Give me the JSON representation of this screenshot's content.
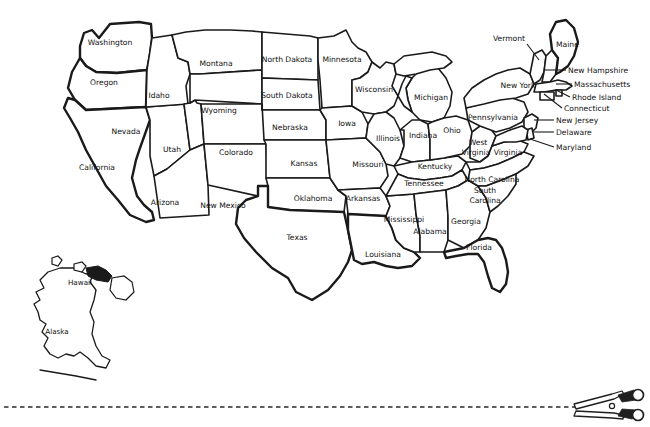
{
  "document": {
    "title": "United States Outline Map",
    "style": "black-and-white printable outline map"
  },
  "map": {
    "name": "United States of America",
    "stroke_color": "#1a1a1a",
    "fill_color": "#ffffff",
    "background_color": "#ffffff",
    "states": [
      {
        "id": "washington",
        "label": "Washington",
        "x": 110,
        "y": 45,
        "anchor": "middle",
        "lines": 1
      },
      {
        "id": "oregon",
        "label": "Oregon",
        "x": 104,
        "y": 85,
        "anchor": "middle",
        "lines": 1
      },
      {
        "id": "california",
        "label": "California",
        "x": 97,
        "y": 170,
        "anchor": "middle",
        "lines": 1
      },
      {
        "id": "idaho",
        "label": "Idaho",
        "x": 159,
        "y": 98,
        "anchor": "middle",
        "lines": 1
      },
      {
        "id": "nevada",
        "label": "Nevada",
        "x": 126,
        "y": 134,
        "anchor": "middle",
        "lines": 1
      },
      {
        "id": "utah",
        "label": "Utah",
        "x": 172,
        "y": 152,
        "anchor": "middle",
        "lines": 1
      },
      {
        "id": "arizona",
        "label": "Arizona",
        "x": 165,
        "y": 205,
        "anchor": "middle",
        "lines": 1
      },
      {
        "id": "montana",
        "label": "Montana",
        "x": 216,
        "y": 66,
        "anchor": "middle",
        "lines": 1
      },
      {
        "id": "wyoming",
        "label": "Wyoming",
        "x": 219,
        "y": 113,
        "anchor": "middle",
        "lines": 1
      },
      {
        "id": "colorado",
        "label": "Colorado",
        "x": 236,
        "y": 155,
        "anchor": "middle",
        "lines": 1
      },
      {
        "id": "new-mexico",
        "label": "New Mexico",
        "x": 223,
        "y": 208,
        "anchor": "middle",
        "lines": 1
      },
      {
        "id": "north-dakota",
        "label": "North  Dakota",
        "x": 287,
        "y": 62,
        "anchor": "middle",
        "lines": 1
      },
      {
        "id": "south-dakota",
        "label": "South  Dakota",
        "x": 287,
        "y": 98,
        "anchor": "middle",
        "lines": 1
      },
      {
        "id": "nebraska",
        "label": "Nebraska",
        "x": 290,
        "y": 130,
        "anchor": "middle",
        "lines": 1
      },
      {
        "id": "kansas",
        "label": "Kansas",
        "x": 304,
        "y": 166,
        "anchor": "middle",
        "lines": 1
      },
      {
        "id": "oklahoma",
        "label": "Oklahoma",
        "x": 313,
        "y": 201,
        "anchor": "middle",
        "lines": 1
      },
      {
        "id": "texas",
        "label": "Texas",
        "x": 297,
        "y": 240,
        "anchor": "middle",
        "lines": 1
      },
      {
        "id": "minnesota",
        "label": "Minnesota",
        "x": 342,
        "y": 62,
        "anchor": "middle",
        "lines": 1
      },
      {
        "id": "iowa",
        "label": "Iowa",
        "x": 347,
        "y": 126,
        "anchor": "middle",
        "lines": 1
      },
      {
        "id": "missouri",
        "label": "Missouri",
        "x": 368,
        "y": 167,
        "anchor": "middle",
        "lines": 1
      },
      {
        "id": "arkansas",
        "label": "Arkansas",
        "x": 363,
        "y": 201,
        "anchor": "middle",
        "lines": 1
      },
      {
        "id": "louisiana",
        "label": "Louisiana",
        "x": 383,
        "y": 257,
        "anchor": "middle",
        "lines": 1
      },
      {
        "id": "wisconsin",
        "label": "Wisconsin",
        "x": 374,
        "y": 92,
        "anchor": "middle",
        "lines": 1
      },
      {
        "id": "illinois",
        "label": "Illinois",
        "x": 388,
        "y": 141,
        "anchor": "middle",
        "lines": 1
      },
      {
        "id": "mississippi",
        "label": "Mississippi",
        "x": 404,
        "y": 222,
        "anchor": "middle",
        "lines": 1
      },
      {
        "id": "michigan",
        "label": "Michigan",
        "x": 431,
        "y": 100,
        "anchor": "middle",
        "lines": 1
      },
      {
        "id": "indiana",
        "label": "Indiana",
        "x": 423,
        "y": 138,
        "anchor": "middle",
        "lines": 1
      },
      {
        "id": "kentucky",
        "label": "Kentucky",
        "x": 435,
        "y": 169,
        "anchor": "middle",
        "lines": 1
      },
      {
        "id": "tennessee",
        "label": "Tennessee",
        "x": 424,
        "y": 186,
        "anchor": "middle",
        "lines": 1
      },
      {
        "id": "alabama",
        "label": "Alabama",
        "x": 430,
        "y": 234,
        "anchor": "middle",
        "lines": 1
      },
      {
        "id": "ohio",
        "label": "Ohio",
        "x": 452,
        "y": 133,
        "anchor": "middle",
        "lines": 1
      },
      {
        "id": "georgia",
        "label": "Georgia",
        "x": 466,
        "y": 224,
        "anchor": "middle",
        "lines": 1
      },
      {
        "id": "florida",
        "label": "Florida",
        "x": 479,
        "y": 250,
        "anchor": "middle",
        "lines": 1
      },
      {
        "id": "west-virginia",
        "label": "West",
        "x": 478,
        "y": 145,
        "anchor": "middle",
        "lines": 2,
        "label_line2": "Virginia",
        "x2": 476,
        "y2": 155
      },
      {
        "id": "virginia",
        "label": "Virginia",
        "x": 508,
        "y": 155,
        "anchor": "middle",
        "lines": 1
      },
      {
        "id": "north-carolina",
        "label": "North Carolina",
        "x": 492,
        "y": 182,
        "anchor": "middle",
        "lines": 1
      },
      {
        "id": "south-carolina",
        "label": "South",
        "x": 485,
        "y": 193,
        "anchor": "middle",
        "lines": 2,
        "label_line2": "Carolina",
        "x2": 485,
        "y2": 203
      },
      {
        "id": "pennsylvania",
        "label": "Pennsylvania",
        "x": 493,
        "y": 120,
        "anchor": "middle",
        "lines": 1
      },
      {
        "id": "new-york",
        "label": "New York",
        "x": 518,
        "y": 88,
        "anchor": "middle",
        "lines": 1
      }
    ],
    "callout_states": [
      {
        "id": "vermont",
        "label": "Vermont",
        "label_x": 525,
        "label_y": 41,
        "anchor": "end",
        "leader": [
          [
            527,
            44
          ],
          [
            539,
            60
          ]
        ]
      },
      {
        "id": "maine",
        "label": "Maine",
        "label_x": 556,
        "label_y": 47,
        "anchor": "start",
        "leader": []
      },
      {
        "id": "new-hampshire",
        "label": "New Hampshire",
        "label_x": 568,
        "label_y": 73,
        "anchor": "start",
        "leader": [
          [
            566,
            70
          ],
          [
            545,
            70
          ]
        ]
      },
      {
        "id": "massachusetts",
        "label": "Massachusetts",
        "label_x": 574,
        "label_y": 87,
        "anchor": "start",
        "leader": [
          [
            572,
            84
          ],
          [
            556,
            84
          ]
        ]
      },
      {
        "id": "rhode-island",
        "label": "Rhode Island",
        "label_x": 572,
        "label_y": 100,
        "anchor": "start",
        "leader": [
          [
            570,
            97
          ],
          [
            556,
            90
          ]
        ]
      },
      {
        "id": "connecticut",
        "label": "Connecticut",
        "label_x": 564,
        "label_y": 111,
        "anchor": "start",
        "leader": [
          [
            562,
            108
          ],
          [
            544,
            94
          ]
        ]
      },
      {
        "id": "new-jersey",
        "label": "New Jersey",
        "label_x": 556,
        "label_y": 123,
        "anchor": "start",
        "leader": [
          [
            554,
            120
          ],
          [
            534,
            120
          ]
        ]
      },
      {
        "id": "delaware",
        "label": "Delaware",
        "label_x": 556,
        "label_y": 135,
        "anchor": "start",
        "leader": [
          [
            554,
            132
          ],
          [
            534,
            132
          ]
        ]
      },
      {
        "id": "maryland",
        "label": "Maryland",
        "label_x": 556,
        "label_y": 150,
        "anchor": "start",
        "leader": [
          [
            554,
            147
          ],
          [
            530,
            139
          ]
        ]
      }
    ],
    "insets": [
      {
        "id": "hawaii",
        "label": "Hawaii",
        "x": 80,
        "y": 285
      },
      {
        "id": "alaska",
        "label": "Alaska",
        "x": 57,
        "y": 334
      }
    ]
  },
  "cut_guide": {
    "name": "cut-here-line",
    "icon": "scissors-icon",
    "dash_color": "#2b2b2b",
    "y": 407
  }
}
